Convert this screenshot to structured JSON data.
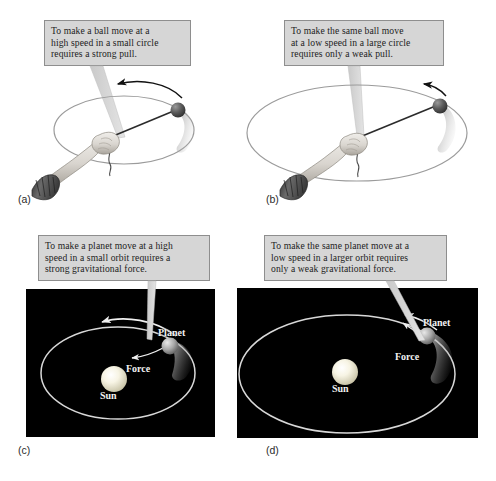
{
  "figure": {
    "background_color": "#ffffff"
  },
  "panels": [
    {
      "id": "a",
      "label": "(a)",
      "kind": "ball-on-string",
      "callout": {
        "lines": [
          "To make a ball move at a",
          "high speed in a small circle",
          "requires a strong pull."
        ],
        "background_color": "#d6d6d6",
        "border_color": "#8e8e8e",
        "text_color": "#1c1c1c"
      },
      "scene": {
        "circle_size": "small",
        "speed": "high",
        "pull": "strong",
        "arrow_direction": "counterclockwise",
        "ball_color": "#555555",
        "orbit_color": "#8c8c8c"
      }
    },
    {
      "id": "b",
      "label": "(b)",
      "kind": "ball-on-string",
      "callout": {
        "lines": [
          "To make the same ball move",
          "at a low speed in a large circle",
          "requires only a weak pull."
        ],
        "background_color": "#d6d6d6",
        "border_color": "#8e8e8e",
        "text_color": "#1c1c1c"
      },
      "scene": {
        "circle_size": "large",
        "speed": "low",
        "pull": "weak",
        "arrow_direction": "counterclockwise",
        "ball_color": "#555555",
        "orbit_color": "#8c8c8c"
      }
    },
    {
      "id": "c",
      "label": "(c)",
      "kind": "planet-orbit",
      "callout": {
        "lines": [
          "To make a planet move at a high",
          "speed in a small orbit requires a",
          "strong gravitational force."
        ],
        "background_color": "#d6d6d6",
        "border_color": "#8e8e8e",
        "text_color": "#1c1c1c"
      },
      "scene": {
        "orbit_size": "small",
        "speed": "high",
        "force": "strong gravitational force",
        "background_color": "#000000",
        "sun_label": "Sun",
        "planet_label": "Planet",
        "force_label": "Force",
        "sun_color": "#f6f3e2",
        "planet_color": "#b9b9b9",
        "orbit_color": "#d8d8d8",
        "label_color": "#f2f2f2"
      }
    },
    {
      "id": "d",
      "label": "(d)",
      "kind": "planet-orbit",
      "callout": {
        "lines": [
          "To make the same planet move at a",
          "low speed in a larger orbit requires",
          "only a weak gravitational force."
        ],
        "background_color": "#d6d6d6",
        "border_color": "#8e8e8e",
        "text_color": "#1c1c1c"
      },
      "scene": {
        "orbit_size": "large",
        "speed": "low",
        "force": "weak gravitational force",
        "background_color": "#000000",
        "sun_label": "Sun",
        "planet_label": "Planet",
        "force_label": "Force",
        "sun_color": "#f6f3e2",
        "planet_color": "#b9b9b9",
        "orbit_color": "#d8d8d8",
        "label_color": "#f2f2f2"
      }
    }
  ]
}
